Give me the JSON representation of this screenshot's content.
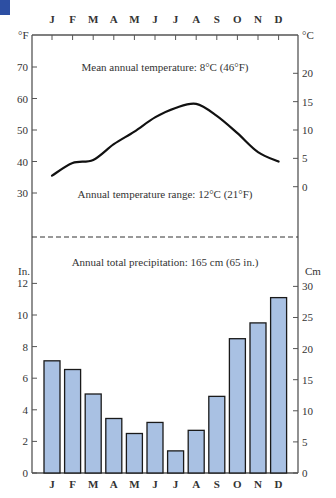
{
  "colors": {
    "corner_block": "#2d4fa3",
    "bar_fill": "#a9c1e3",
    "bar_stroke": "#1a1a1a",
    "axis": "#555555",
    "curve": "#111111"
  },
  "months": [
    "J",
    "F",
    "M",
    "A",
    "M",
    "J",
    "J",
    "A",
    "S",
    "O",
    "N",
    "D"
  ],
  "temperature": {
    "left_unit": "°F",
    "right_unit": "°C",
    "left_ticks": [
      70,
      60,
      50,
      40,
      30
    ],
    "right_ticks": [
      20,
      15,
      10,
      5,
      0
    ],
    "mean_label": "Mean annual temperature: 8°C (46°F)",
    "range_label": "Annual temperature range: 12°C (21°F)"
  },
  "precipitation": {
    "left_unit": "In.",
    "right_unit": "Cm",
    "left_ticks": [
      12,
      10,
      8,
      6,
      4,
      2,
      0
    ],
    "right_ticks": [
      30,
      25,
      20,
      15,
      10,
      5,
      0
    ],
    "total_label": "Annual total precipitation: 165 cm (65 in.)"
  },
  "chart_data": [
    {
      "type": "line",
      "title": "Mean monthly temperature",
      "categories": [
        "J",
        "F",
        "M",
        "A",
        "M",
        "J",
        "J",
        "A",
        "S",
        "O",
        "N",
        "D"
      ],
      "values": [
        35.5,
        39.5,
        40.5,
        45.5,
        49.5,
        54,
        57,
        58.3,
        54.5,
        49,
        43,
        40
      ],
      "ylabel": "°F",
      "ylabel_right": "°C",
      "ylim": [
        25,
        80
      ],
      "yticks_left": [
        30,
        40,
        50,
        60,
        70
      ],
      "yticks_right": [
        0,
        5,
        10,
        15,
        20
      ],
      "annotations": [
        "Mean annual temperature: 8°C (46°F)",
        "Annual temperature range: 12°C (21°F)"
      ],
      "grid": false
    },
    {
      "type": "bar",
      "title": "Mean monthly precipitation",
      "categories": [
        "J",
        "F",
        "M",
        "A",
        "M",
        "J",
        "J",
        "A",
        "S",
        "O",
        "N",
        "D"
      ],
      "values": [
        7.1,
        6.55,
        5.0,
        3.45,
        2.5,
        3.2,
        1.4,
        2.7,
        4.85,
        8.5,
        9.5,
        11.1
      ],
      "ylabel": "In.",
      "ylabel_right": "Cm",
      "ylim": [
        0,
        14
      ],
      "yticks_left": [
        0,
        2,
        4,
        6,
        8,
        10,
        12
      ],
      "yticks_right": [
        0,
        5,
        10,
        15,
        20,
        25,
        30
      ],
      "annotations": [
        "Annual total precipitation: 165 cm (65 in.)"
      ],
      "grid": false
    }
  ]
}
